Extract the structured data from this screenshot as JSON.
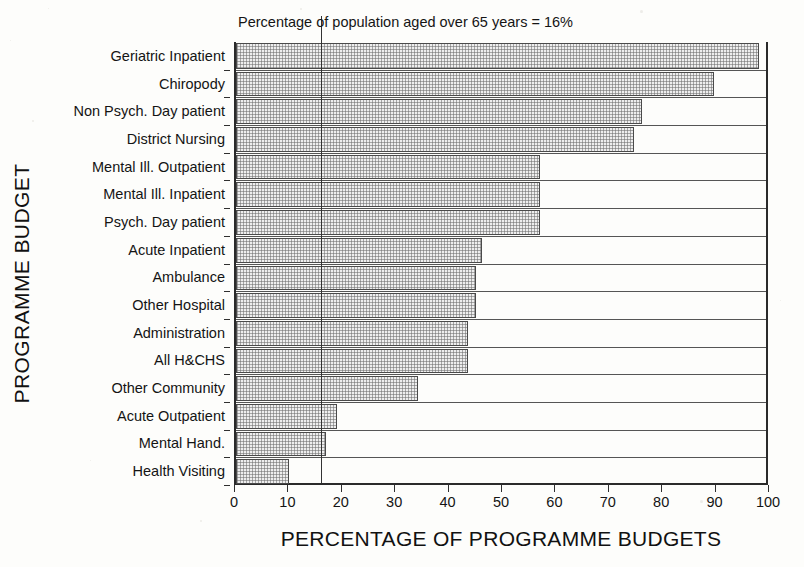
{
  "chart_data": {
    "type": "bar",
    "orientation": "horizontal",
    "title": "",
    "xlabel": "PERCENTAGE OF PROGRAMME BUDGETS",
    "ylabel": "PROGRAMME BUDGET",
    "xlim": [
      0,
      100
    ],
    "xticks": [
      0,
      10,
      20,
      30,
      40,
      50,
      60,
      70,
      80,
      90,
      100
    ],
    "xtick_labels": [
      "0",
      "10",
      "20",
      "30",
      "40",
      "50",
      "60",
      "70",
      "80",
      "90",
      "100"
    ],
    "grid": false,
    "legend": null,
    "annotations": [
      {
        "text": "Percentage of population aged over 65 years = 16%",
        "type": "vertical-reference-line",
        "value": 16
      }
    ],
    "categories": [
      "Geriatric Inpatient",
      "Chiropody",
      "Non Psych. Day patient",
      "District Nursing",
      "Mental Ill. Outpatient",
      "Mental Ill. Inpatient",
      "Psych. Day patient",
      "Acute Inpatient",
      "Ambulance",
      "Other Hospital",
      "Administration",
      "All H&CHS",
      "Other Community",
      "Acute Outpatient",
      "Mental Hand.",
      "Health Visiting"
    ],
    "values": [
      98,
      89.5,
      76,
      74.5,
      57,
      57,
      57,
      46,
      45,
      45,
      43.5,
      43.5,
      34,
      19,
      16.8,
      10
    ]
  },
  "style": {
    "bar_fill": "#eeeeee",
    "bar_edge": "#4a4a4a",
    "axis_color": "#2a2a2a",
    "text_color": "#141414",
    "background": "#fdfdfb"
  }
}
